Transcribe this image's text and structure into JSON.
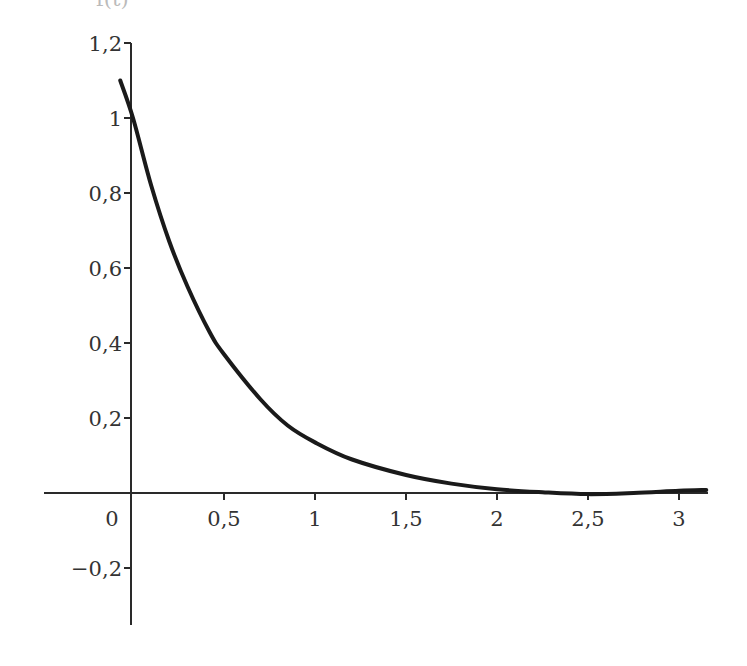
{
  "chart_data": {
    "type": "line",
    "title": "",
    "ylabel_cropped": "f(t)",
    "xlabel": "",
    "xlim": [
      -0.5,
      3.15
    ],
    "ylim": [
      -0.35,
      1.22
    ],
    "grid": false,
    "legend": null,
    "x_ticks": [
      0.5,
      1,
      1.5,
      2,
      2.5,
      3
    ],
    "x_tick_labels": [
      "0,5",
      "1",
      "1,5",
      "2",
      "2,5",
      "3"
    ],
    "origin_label": "0",
    "y_ticks": [
      1.2,
      1,
      0.8,
      0.6,
      0.4,
      0.2,
      -0.2
    ],
    "y_tick_labels": [
      "1,2",
      "1",
      "0,8",
      "0,6",
      "0,4",
      "0,2",
      "−0,2"
    ],
    "series": [
      {
        "name": "f(t)",
        "description": "decaying curve approximately e^(-2t) with tiny undershoot near t=2.5",
        "x": [
          -0.07,
          0,
          0.1,
          0.2,
          0.3,
          0.42,
          0.5,
          0.7,
          0.85,
          1.0,
          1.2,
          1.5,
          1.75,
          2.0,
          2.25,
          2.5,
          2.75,
          3.0,
          3.15
        ],
        "y": [
          1.1,
          1.0,
          0.82,
          0.67,
          0.55,
          0.43,
          0.37,
          0.25,
          0.18,
          0.135,
          0.09,
          0.048,
          0.025,
          0.01,
          0.002,
          -0.003,
          0.0,
          0.006,
          0.008
        ],
        "color": "#1a1a1a"
      }
    ],
    "colors": {
      "axis": "#2a2a2a",
      "curve": "#1a1a1a",
      "labels": "#333333",
      "background": "#ffffff"
    }
  }
}
